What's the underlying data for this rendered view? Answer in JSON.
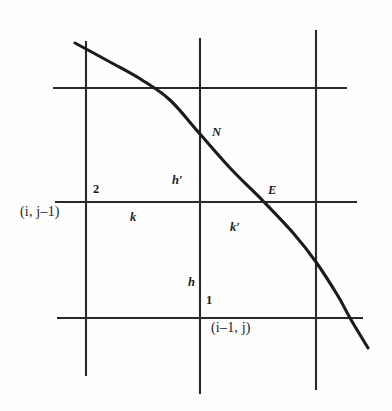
{
  "figure": {
    "kind": "grid-interface-diagram",
    "width": 392,
    "height": 411,
    "background_color": "#fefefe",
    "line_color": "#2a2a2a",
    "curve_color": "#1b1b1b"
  },
  "labels": {
    "node_2": "2",
    "node_1": "1",
    "point_N": "N",
    "point_E": "E",
    "spacing_h_prime": "h′",
    "spacing_h": "h",
    "spacing_k": "k",
    "spacing_k_prime": "k′",
    "index_i_j_minus_1": "(i, j–1)",
    "index_i_minus_1_j": "(i–1, j)"
  },
  "chart_data": {
    "type": "diagram",
    "title": "",
    "xlabel": "",
    "ylabel": "",
    "grid": true,
    "legend": null,
    "axis_ranges": {
      "x": [
        0,
        392
      ],
      "y": [
        0,
        411
      ]
    },
    "grid_lines": {
      "vertical": [
        {
          "name": "v-left",
          "x": 86,
          "y_top": 41,
          "y_bottom": 376
        },
        {
          "name": "v-center",
          "x": 200,
          "y_top": 38,
          "y_bottom": 394
        },
        {
          "name": "v-right",
          "x": 316,
          "y_top": 30,
          "y_bottom": 390
        }
      ],
      "horizontal": [
        {
          "name": "h-top",
          "y": 88,
          "x_left": 53,
          "x_right": 347
        },
        {
          "name": "h-middle",
          "y": 202,
          "x_left": 55,
          "x_right": 357
        },
        {
          "name": "h-bottom",
          "y": 318,
          "x_left": 57,
          "x_right": 363
        }
      ]
    },
    "curve": {
      "name": "interface-curve",
      "description": "monotonically decreasing boundary curve crossing the grid from upper-left to lower-right",
      "points": [
        [
          75,
          43
        ],
        [
          110,
          62
        ],
        [
          142,
          80
        ],
        [
          170,
          100
        ],
        [
          200,
          134
        ],
        [
          232,
          170
        ],
        [
          264,
          202
        ],
        [
          294,
          234
        ],
        [
          316,
          262
        ],
        [
          338,
          296
        ],
        [
          350,
          318
        ],
        [
          368,
          348
        ]
      ]
    },
    "annotated_points": [
      {
        "label": "N",
        "at": [
          200,
          134
        ],
        "label_pos": [
          212,
          127
        ]
      },
      {
        "label": "E",
        "at": [
          264,
          202
        ],
        "label_pos": [
          268,
          184
        ]
      },
      {
        "label": "2",
        "at": [
          86,
          202
        ],
        "label_pos": [
          93,
          183
        ]
      },
      {
        "label": "1",
        "at": [
          200,
          318
        ],
        "label_pos": [
          206,
          294
        ]
      }
    ],
    "spacing_annotations": [
      {
        "label": "h′",
        "label_pos": [
          173,
          175
        ],
        "between": [
          "N",
          "2-row"
        ]
      },
      {
        "label": "h",
        "label_pos": [
          188,
          277
        ],
        "between": [
          "1",
          "2-row"
        ]
      },
      {
        "label": "k",
        "label_pos": [
          131,
          211
        ],
        "between": [
          "2",
          "center-node"
        ]
      },
      {
        "label": "k′",
        "label_pos": [
          231,
          221
        ],
        "between": [
          "center-node",
          "E"
        ]
      }
    ]
  }
}
